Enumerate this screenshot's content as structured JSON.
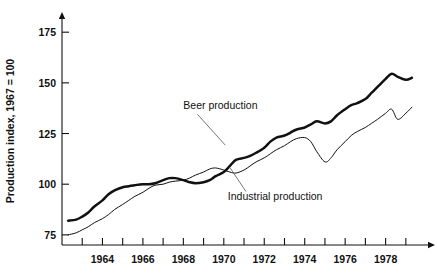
{
  "chart_data": {
    "type": "line",
    "title": "",
    "xlabel": "",
    "ylabel": "Production index, 1967 = 100",
    "xlim": [
      1962.0,
      1979.7
    ],
    "ylim": [
      70,
      182
    ],
    "grid": false,
    "legend_position": "inline-annotations",
    "y_ticks": [
      75,
      100,
      125,
      150,
      175
    ],
    "y_tick_labels": [
      "75",
      "100",
      "125",
      "150",
      "175"
    ],
    "x_ticks": [
      1963,
      1964,
      1965,
      1966,
      1967,
      1968,
      1969,
      1970,
      1971,
      1972,
      1973,
      1974,
      1975,
      1976,
      1977,
      1978,
      1979
    ],
    "x_tick_labels": [
      "",
      "1964",
      "",
      "1966",
      "",
      "1968",
      "",
      "1970",
      "",
      "1972",
      "",
      "1974",
      "",
      "1976",
      "",
      "1978",
      ""
    ],
    "annotations": [
      {
        "text": "Beer production",
        "x": 1968.0,
        "y": 137.0
      },
      {
        "text": "Industrial production",
        "x": 1970.2,
        "y": 92.0
      }
    ],
    "series": [
      {
        "name": "Beer production",
        "style": "thick",
        "x": [
          1962.3,
          1962.7,
          1963.0,
          1963.3,
          1963.6,
          1964.0,
          1964.3,
          1964.6,
          1965.0,
          1965.3,
          1965.6,
          1966.0,
          1966.3,
          1966.6,
          1967.0,
          1967.3,
          1967.6,
          1968.0,
          1968.3,
          1968.6,
          1969.0,
          1969.3,
          1969.6,
          1970.0,
          1970.3,
          1970.6,
          1971.0,
          1971.3,
          1971.6,
          1972.0,
          1972.3,
          1972.6,
          1973.0,
          1973.3,
          1973.6,
          1974.0,
          1974.3,
          1974.6,
          1975.0,
          1975.3,
          1975.6,
          1976.0,
          1976.3,
          1976.6,
          1977.0,
          1977.3,
          1977.6,
          1978.0,
          1978.3,
          1978.6,
          1979.0,
          1979.3
        ],
        "y": [
          82,
          82.5,
          84,
          86,
          89,
          92,
          95,
          97,
          98.5,
          99,
          99.5,
          100,
          100,
          100.5,
          102,
          103,
          103,
          102,
          101,
          100.5,
          101,
          102,
          104,
          106,
          109,
          112,
          113,
          114,
          115.5,
          118,
          121,
          123,
          124,
          125.5,
          127,
          128,
          129.5,
          131,
          130,
          131,
          134,
          137,
          139,
          140,
          142,
          145,
          148,
          152,
          154.5,
          153,
          151.5,
          152.5
        ]
      },
      {
        "name": "Industrial production",
        "style": "thin",
        "x": [
          1962.3,
          1962.7,
          1963.0,
          1963.3,
          1963.6,
          1964.0,
          1964.3,
          1964.6,
          1965.0,
          1965.3,
          1965.6,
          1966.0,
          1966.3,
          1966.6,
          1967.0,
          1967.3,
          1967.6,
          1968.0,
          1968.3,
          1968.6,
          1969.0,
          1969.3,
          1969.6,
          1970.0,
          1970.3,
          1970.6,
          1971.0,
          1971.3,
          1971.6,
          1972.0,
          1972.3,
          1972.6,
          1973.0,
          1973.3,
          1973.6,
          1974.0,
          1974.3,
          1974.6,
          1975.0,
          1975.3,
          1975.6,
          1976.0,
          1976.3,
          1976.6,
          1977.0,
          1977.3,
          1977.6,
          1978.0,
          1978.3,
          1978.6,
          1979.0,
          1979.3
        ],
        "y": [
          75,
          76,
          77.5,
          79,
          81,
          83,
          85,
          87.5,
          90,
          92,
          94,
          96,
          98,
          99.5,
          100,
          101,
          101.5,
          102,
          103,
          104.5,
          106,
          107.5,
          108,
          107,
          106,
          105.5,
          107,
          109,
          111,
          113,
          115,
          117,
          119,
          121,
          122.5,
          123,
          121,
          116,
          111,
          113,
          117,
          121,
          124,
          126,
          128,
          130,
          132,
          135,
          137,
          132,
          135,
          138
        ]
      }
    ]
  },
  "plot_geometry": {
    "left": 62,
    "right": 420,
    "top": 18,
    "bottom": 245
  },
  "axis_arrows": {
    "y_arrow": "up",
    "x_arrow": "right"
  }
}
